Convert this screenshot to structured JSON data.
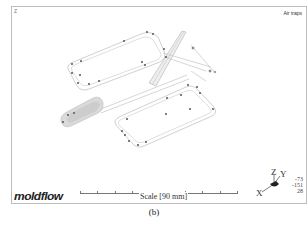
{
  "viewport": {
    "corner_mark": "Z",
    "result_title": "Air traps",
    "logo": "moldflow",
    "scale": {
      "label": "Scale [90 mm]",
      "ticks": 8
    },
    "axis_triad": {
      "x_label": "X",
      "y_label": "Y",
      "z_label": "Z"
    },
    "view_angles": [
      "-73",
      "-151",
      "28"
    ]
  },
  "caption": "(b)",
  "colors": {
    "frame": "#bdbdbd",
    "wireframe": "#b8b8b8",
    "air_trap_marker": "#444444",
    "runner_shade": "#c8c8c8"
  }
}
